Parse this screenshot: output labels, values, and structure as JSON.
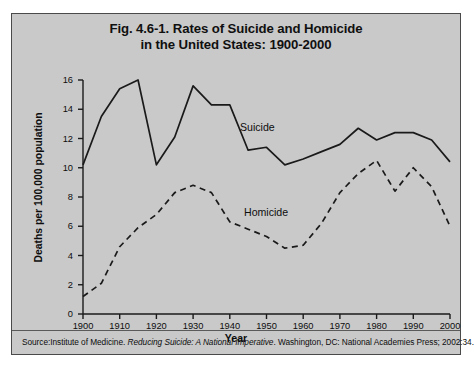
{
  "figure": {
    "title_line1": "Fig. 4.6-1. Rates of Suicide and Homicide",
    "title_line2": "in the United States: 1900-2000",
    "source_prefix": "Source:Institute of Medicine. ",
    "source_italic": "Reducing Suicide: A National Imperative",
    "source_suffix": ". Washington, DC: National Academies Press; 2002:34.",
    "background_color": "#c9c9c9",
    "line_color": "#1a1a1a",
    "border_color": "#4a4a4a"
  },
  "chart_data": {
    "type": "line",
    "title": "Fig. 4.6-1. Rates of Suicide and Homicide in the United States: 1900-2000",
    "xlabel": "Year",
    "ylabel": "Deaths per 100,000 population",
    "xlim": [
      1900,
      2000
    ],
    "ylim": [
      0,
      16
    ],
    "xticks": [
      1900,
      1910,
      1920,
      1930,
      1940,
      1950,
      1960,
      1970,
      1980,
      1990,
      2000
    ],
    "yticks": [
      0,
      2,
      4,
      6,
      8,
      10,
      12,
      14,
      16
    ],
    "grid": false,
    "legend": "inline-labels",
    "annotations": [
      "Suicide",
      "Homicide"
    ],
    "series": [
      {
        "name": "Suicide",
        "style": "solid",
        "x": [
          1900,
          1905,
          1910,
          1915,
          1920,
          1925,
          1930,
          1935,
          1940,
          1945,
          1950,
          1955,
          1960,
          1965,
          1970,
          1975,
          1980,
          1985,
          1990,
          1995,
          2000
        ],
        "values": [
          10.2,
          13.5,
          15.4,
          16.0,
          10.2,
          12.1,
          15.6,
          14.3,
          14.3,
          11.2,
          11.4,
          10.2,
          10.6,
          11.1,
          11.6,
          12.7,
          11.9,
          12.4,
          12.4,
          11.9,
          10.4
        ]
      },
      {
        "name": "Homicide",
        "style": "dashed",
        "x": [
          1900,
          1905,
          1910,
          1915,
          1920,
          1925,
          1930,
          1935,
          1940,
          1945,
          1950,
          1955,
          1960,
          1965,
          1970,
          1975,
          1980,
          1985,
          1990,
          1995,
          2000
        ],
        "values": [
          1.2,
          2.1,
          4.6,
          5.9,
          6.8,
          8.3,
          8.8,
          8.3,
          6.3,
          5.8,
          5.3,
          4.5,
          4.7,
          6.2,
          8.3,
          9.6,
          10.5,
          8.4,
          10.0,
          8.7,
          6.0
        ]
      }
    ]
  },
  "axis": {
    "x_title": "Year",
    "y_title": "Deaths per 100,000 population"
  }
}
